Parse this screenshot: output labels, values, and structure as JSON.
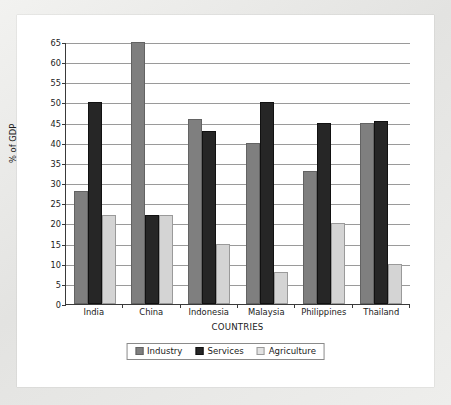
{
  "chart_data": {
    "type": "bar",
    "title": "",
    "xlabel": "COUNTRIES",
    "ylabel": "% of GDP",
    "ylim": [
      0,
      65
    ],
    "ytick_step": 5,
    "yticks": [
      0,
      5,
      10,
      15,
      20,
      25,
      30,
      35,
      40,
      45,
      50,
      55,
      60,
      65
    ],
    "grid": "horizontal",
    "legend_position": "bottom",
    "categories": [
      "India",
      "China",
      "Indonesia",
      "Malaysia",
      "Philippines",
      "Thailand"
    ],
    "series": [
      {
        "name": "Industry",
        "color": "#7f7f7f",
        "values": [
          28,
          65,
          46,
          40,
          33,
          45
        ]
      },
      {
        "name": "Services",
        "color": "#262626",
        "values": [
          50,
          22,
          43,
          50,
          45,
          45.5
        ]
      },
      {
        "name": "Agriculture",
        "color": "#d4d4d4",
        "values": [
          22,
          22,
          15,
          8,
          20,
          10
        ]
      }
    ]
  },
  "legend": {
    "items": [
      {
        "label": "Industry"
      },
      {
        "label": "Services"
      },
      {
        "label": "Agriculture"
      }
    ]
  }
}
